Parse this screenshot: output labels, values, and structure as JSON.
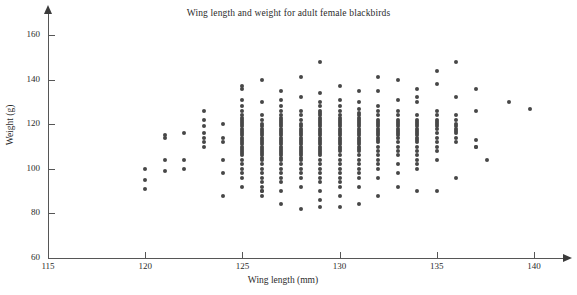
{
  "chart_data": {
    "type": "scatter",
    "title": "Wing length and weight for adult female blackbirds",
    "xlabel": "Wing length (mm)",
    "ylabel": "Weight (g)",
    "xlim": [
      115,
      140
    ],
    "ylim": [
      60,
      160
    ],
    "xticks": [
      115,
      120,
      125,
      130,
      135,
      140
    ],
    "yticks": [
      60,
      80,
      100,
      120,
      140,
      160
    ],
    "grid": false,
    "legend": null,
    "marker": {
      "shape": "circle",
      "color": "#474747",
      "size_px": 4
    },
    "x": [
      120,
      120,
      120,
      121,
      121,
      121,
      121,
      122,
      122,
      122,
      123,
      123,
      123,
      123,
      123,
      123,
      123,
      124,
      124,
      124,
      124,
      124,
      124,
      125,
      125,
      125,
      125,
      125,
      125,
      125,
      125,
      125,
      125,
      125,
      125,
      125,
      125,
      125,
      125,
      125,
      125,
      125,
      125,
      125,
      125,
      125,
      125,
      125,
      125,
      125,
      125,
      125,
      125,
      126,
      126,
      126,
      126,
      126,
      126,
      126,
      126,
      126,
      126,
      126,
      126,
      126,
      126,
      126,
      126,
      126,
      126,
      126,
      126,
      126,
      126,
      126,
      126,
      126,
      126,
      126,
      126,
      126,
      126,
      127,
      127,
      127,
      127,
      127,
      127,
      127,
      127,
      127,
      127,
      127,
      127,
      127,
      127,
      127,
      127,
      127,
      127,
      127,
      127,
      127,
      127,
      127,
      127,
      127,
      127,
      127,
      127,
      127,
      127,
      127,
      127,
      128,
      128,
      128,
      128,
      128,
      128,
      128,
      128,
      128,
      128,
      128,
      128,
      128,
      128,
      128,
      128,
      128,
      128,
      128,
      128,
      128,
      128,
      128,
      128,
      128,
      128,
      128,
      128,
      129,
      129,
      129,
      129,
      129,
      129,
      129,
      129,
      129,
      129,
      129,
      129,
      129,
      129,
      129,
      129,
      129,
      129,
      129,
      129,
      129,
      129,
      129,
      129,
      129,
      129,
      129,
      129,
      129,
      129,
      129,
      129,
      129,
      129,
      130,
      130,
      130,
      130,
      130,
      130,
      130,
      130,
      130,
      130,
      130,
      130,
      130,
      130,
      130,
      130,
      130,
      130,
      130,
      130,
      130,
      130,
      130,
      130,
      130,
      130,
      130,
      130,
      130,
      130,
      130,
      131,
      131,
      131,
      131,
      131,
      131,
      131,
      131,
      131,
      131,
      131,
      131,
      131,
      131,
      131,
      131,
      131,
      131,
      131,
      131,
      131,
      131,
      131,
      131,
      131,
      131,
      131,
      131,
      131,
      132,
      132,
      132,
      132,
      132,
      132,
      132,
      132,
      132,
      132,
      132,
      132,
      132,
      132,
      132,
      132,
      132,
      132,
      132,
      132,
      132,
      132,
      132,
      132,
      133,
      133,
      133,
      133,
      133,
      133,
      133,
      133,
      133,
      133,
      133,
      133,
      133,
      133,
      133,
      133,
      133,
      133,
      133,
      133,
      134,
      134,
      134,
      134,
      134,
      134,
      134,
      134,
      134,
      134,
      134,
      134,
      134,
      134,
      134,
      134,
      134,
      134,
      134,
      134,
      134,
      134,
      135,
      135,
      135,
      135,
      135,
      135,
      135,
      135,
      135,
      135,
      135,
      135,
      135,
      135,
      135,
      135,
      136,
      136,
      136,
      136,
      136,
      136,
      136,
      136,
      136,
      136,
      136,
      136,
      137,
      137,
      137,
      137,
      137,
      137.6,
      138.7,
      139.8
    ],
    "y": [
      100,
      95,
      91,
      115,
      114,
      104,
      99,
      116,
      104,
      100,
      126,
      122,
      119,
      116,
      114,
      112,
      110,
      120,
      114,
      112,
      104,
      98,
      88,
      137,
      136,
      131,
      128,
      126,
      124,
      123,
      122,
      121,
      120,
      119,
      118,
      117,
      116,
      115,
      114,
      113,
      112,
      111,
      110,
      109,
      108,
      107,
      106,
      104,
      102,
      100,
      98,
      96,
      92,
      90,
      140,
      130,
      124,
      122,
      120,
      119,
      118,
      117,
      116,
      115,
      114,
      113,
      112,
      111,
      110,
      109,
      108,
      107,
      106,
      105,
      104,
      102,
      100,
      98,
      96,
      94,
      92,
      90,
      88,
      84,
      135,
      131,
      128,
      126,
      124,
      123,
      122,
      121,
      120,
      119,
      118,
      117,
      116,
      115,
      114,
      113,
      112,
      111,
      110,
      109,
      108,
      107,
      106,
      105,
      104,
      102,
      100,
      98,
      96,
      94,
      90,
      82,
      141,
      132,
      126,
      124,
      122,
      120,
      119,
      118,
      117,
      116,
      115,
      114,
      113,
      112,
      111,
      110,
      109,
      108,
      107,
      106,
      105,
      104,
      102,
      100,
      98,
      96,
      92,
      83,
      148,
      134,
      130,
      128,
      126,
      125,
      124,
      123,
      122,
      121,
      120,
      119,
      118,
      117,
      116,
      115,
      114,
      113,
      112,
      111,
      110,
      109,
      108,
      107,
      106,
      104,
      102,
      100,
      98,
      96,
      94,
      90,
      86,
      83,
      137,
      131,
      128,
      126,
      124,
      123,
      122,
      121,
      120,
      119,
      118,
      117,
      116,
      115,
      114,
      113,
      112,
      111,
      110,
      109,
      108,
      106,
      104,
      102,
      100,
      98,
      96,
      94,
      92,
      88,
      84,
      135,
      130,
      127,
      125,
      124,
      123,
      122,
      121,
      120,
      119,
      118,
      117,
      116,
      115,
      114,
      113,
      112,
      111,
      110,
      109,
      108,
      106,
      104,
      102,
      100,
      98,
      96,
      92,
      88,
      141,
      135,
      128,
      126,
      124,
      122,
      121,
      120,
      119,
      118,
      117,
      116,
      115,
      114,
      113,
      112,
      110,
      108,
      106,
      104,
      102,
      100,
      96,
      92,
      140,
      131,
      126,
      124,
      122,
      121,
      120,
      119,
      118,
      117,
      116,
      115,
      114,
      112,
      110,
      108,
      106,
      102,
      98,
      90,
      136,
      132,
      130,
      124,
      122,
      121,
      120,
      119,
      118,
      117,
      116,
      115,
      114,
      113,
      112,
      110,
      108,
      106,
      104,
      102,
      100,
      90,
      144,
      138,
      126,
      124,
      122,
      121,
      120,
      119,
      118,
      116,
      114,
      112,
      110,
      108,
      104,
      96,
      148,
      132,
      124,
      122,
      120,
      119,
      118,
      117,
      116,
      114,
      112,
      110,
      136,
      126,
      113,
      110,
      104,
      130,
      127,
      143
    ]
  }
}
